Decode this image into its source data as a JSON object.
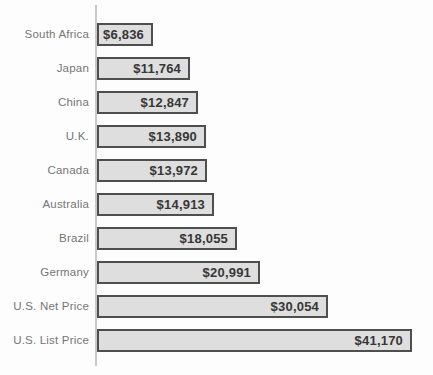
{
  "chart_data": {
    "type": "bar",
    "orientation": "horizontal",
    "title": "",
    "xlabel": "",
    "ylabel": "",
    "categories": [
      "South Africa",
      "Japan",
      "China",
      "U.K.",
      "Canada",
      "Australia",
      "Brazil",
      "Germany",
      "U.S. Net Price",
      "U.S. List Price"
    ],
    "values": [
      6836,
      11764,
      12847,
      13890,
      13972,
      14913,
      18055,
      20991,
      30054,
      41170
    ],
    "value_labels": [
      "$6,836",
      "$11,764",
      "$12,847",
      "$13,890",
      "$13,972",
      "$14,913",
      "$18,055",
      "$20,991",
      "$30,054",
      "$41,170"
    ],
    "xlim": [
      0,
      41170
    ],
    "grid": false,
    "legend": false,
    "value_label_position": "inside-end",
    "bar_fill_color": "#dedede",
    "bar_border_color": "#4e4e4e",
    "category_label_color": "#767676",
    "value_label_color": "#373737",
    "axis_line_color": "#c9c9c9",
    "background_color": "#fdfdfd"
  }
}
